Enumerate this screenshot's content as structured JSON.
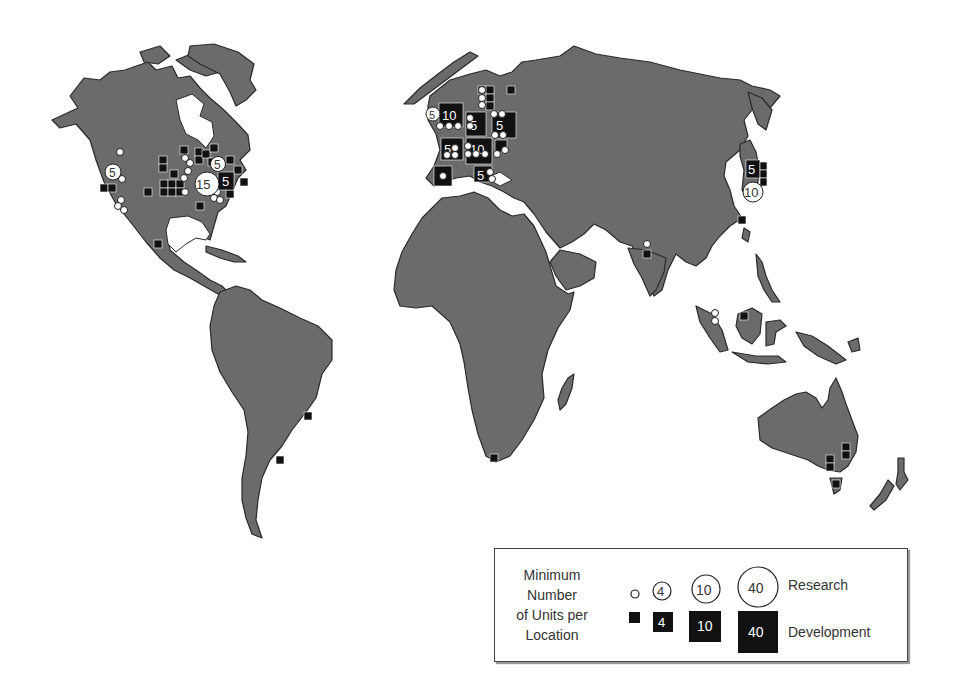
{
  "map": {
    "title": "Worldwide R&D Unit Locations",
    "land_color": "#6b6b6b",
    "marker_colors": {
      "development": "#111111",
      "research": "#ffffff"
    }
  },
  "legend": {
    "title_lines": [
      "Minimum",
      "Number",
      "of Units per",
      "Location"
    ],
    "research_label": "Research",
    "development_label": "Development",
    "sizes": [
      {
        "research": "",
        "development": ""
      },
      {
        "research": "4",
        "development": "4"
      },
      {
        "research": "10",
        "development": "10"
      },
      {
        "research": "40",
        "development": "40"
      }
    ]
  },
  "labeled_markers": [
    {
      "region": "US West",
      "type": "research",
      "value": "5"
    },
    {
      "region": "US East (Midwest)",
      "type": "research",
      "value": "15"
    },
    {
      "region": "US Northeast",
      "type": "research",
      "value": "5"
    },
    {
      "region": "US Northeast",
      "type": "development",
      "value": "5"
    },
    {
      "region": "UK",
      "type": "research",
      "value": "5"
    },
    {
      "region": "UK",
      "type": "development",
      "value": "10"
    },
    {
      "region": "Germany North",
      "type": "development",
      "value": "5"
    },
    {
      "region": "Scandinavia/Baltic",
      "type": "development",
      "value": "5"
    },
    {
      "region": "France",
      "type": "development",
      "value": "5"
    },
    {
      "region": "Germany South/Switzerland",
      "type": "development",
      "value": "10"
    },
    {
      "region": "Italy",
      "type": "development",
      "value": "5"
    },
    {
      "region": "Japan",
      "type": "development",
      "value": "5"
    },
    {
      "region": "Japan",
      "type": "research",
      "value": "10"
    }
  ]
}
